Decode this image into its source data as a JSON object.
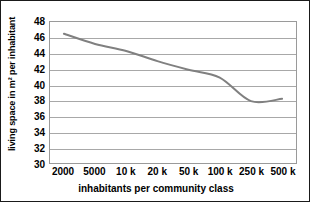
{
  "chart_data": {
    "type": "line",
    "title": "",
    "xlabel": "inhabitants per community class",
    "ylabel": "living space in m² per inhabitant",
    "categories": [
      "2000",
      "5000",
      "10 k",
      "20 k",
      "50 k",
      "100 k",
      "250 k",
      "500 k"
    ],
    "values": [
      46.5,
      45.2,
      44.3,
      43.0,
      41.9,
      40.9,
      37.9,
      38.2
    ],
    "series": [
      {
        "name": "living space per inhabitant",
        "values": [
          46.5,
          45.2,
          44.3,
          43.0,
          41.9,
          40.9,
          37.9,
          38.2
        ],
        "color": "#808080"
      }
    ],
    "ylim": [
      30,
      48
    ],
    "ytick_labels": [
      "48",
      "46",
      "44",
      "42",
      "40",
      "38",
      "36",
      "34",
      "32",
      "30"
    ],
    "ytick_values": [
      48,
      46,
      44,
      42,
      40,
      38,
      36,
      34,
      32,
      30
    ],
    "ystep": 2,
    "grid": true,
    "grid_axis": "y",
    "legend": "none",
    "smoothing": true,
    "line_color": "#808080",
    "grid_color": "#a8a8a8",
    "axis_color": "#9a9a9a",
    "background_color": "#ffffff",
    "border_color": "#1a1a1a"
  }
}
